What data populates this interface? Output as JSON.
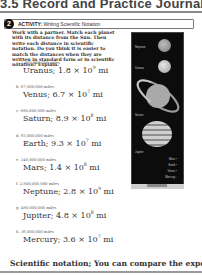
{
  "header": {
    "title": "3.5 Record and Practice Journal"
  },
  "activity": {
    "number": "2",
    "label": "ACTIVITY:",
    "title": "Writing Scientific Notation"
  },
  "intro": "Work with a partner. Match each planet with its distance from the Sun. Then write each distance in scientific notation. Do you think it is easier to match the distances when they are written in standard form or in scientific notation? Explain.",
  "items": [
    {
      "letter": "a.",
      "distance": "1,800,000,000 miles",
      "planet": "Uranus;",
      "mantissa": "1.8",
      "exponent": "9",
      "unit": "mi"
    },
    {
      "letter": "b.",
      "distance": "67,000,000 miles",
      "planet": "Venus;",
      "mantissa": "6.7",
      "exponent": "7",
      "unit": "mi"
    },
    {
      "letter": "c.",
      "distance": "890,000,000 miles",
      "planet": "Saturn;",
      "mantissa": "8.9",
      "exponent": "8",
      "unit": "mi"
    },
    {
      "letter": "d.",
      "distance": "93,000,000 miles",
      "planet": "Earth;",
      "mantissa": "9.3",
      "exponent": "7",
      "unit": "mi"
    },
    {
      "letter": "e.",
      "distance": "140,000,000 miles",
      "planet": "Mars;",
      "mantissa": "1.4",
      "exponent": "8",
      "unit": "mi"
    },
    {
      "letter": "f.",
      "distance": "2,800,000,000 miles",
      "planet": "Neptune;",
      "mantissa": "2.8",
      "exponent": "9",
      "unit": "mi"
    },
    {
      "letter": "g.",
      "distance": "480,000,000 miles",
      "planet": "Jupiter;",
      "mantissa": "4.8",
      "exponent": "8",
      "unit": "mi"
    },
    {
      "letter": "h.",
      "distance": "36,000,000 miles",
      "planet": "Mercury;",
      "mantissa": "3.6",
      "exponent": "7",
      "unit": "mi"
    }
  ],
  "times": "×",
  "ten": "10",
  "image": {
    "labels": {
      "neptune": "Neptune",
      "uranus": "Uranus",
      "saturn": "Saturn",
      "jupiter": "Jupiter"
    },
    "legend": [
      "Mars",
      "Earth",
      "Venus",
      "Mercury"
    ],
    "footer": "Sun"
  },
  "answer": "Scientific notation; You can compare the exponents."
}
